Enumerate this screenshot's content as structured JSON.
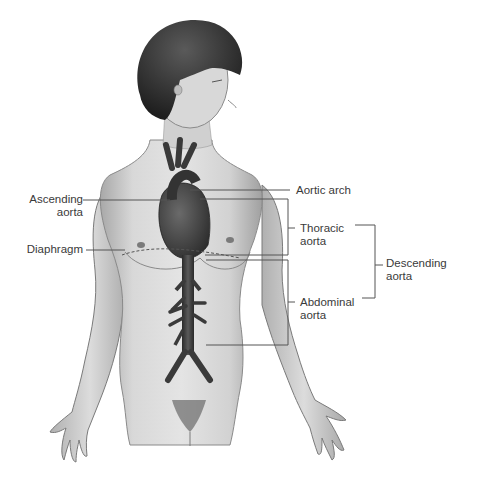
{
  "figure": {
    "labels": {
      "ascending_aorta": [
        "Ascending",
        "aorta"
      ],
      "diaphragm": [
        "Diaphragm"
      ],
      "aortic_arch": [
        "Aortic arch"
      ],
      "thoracic_aorta": [
        "Thoracic",
        "aorta"
      ],
      "abdominal_aorta": [
        "Abdominal",
        "aorta"
      ],
      "descending_aorta": [
        "Descending",
        "aorta"
      ]
    },
    "colors": {
      "background": "#ffffff",
      "skin": "#d6d6d6",
      "skin_shadow": "#9a9a9a",
      "hair": "#2e2e2e",
      "aorta": "#3a3a3a",
      "leader_line": "#555555",
      "label_text": "#3a3a3a"
    }
  }
}
